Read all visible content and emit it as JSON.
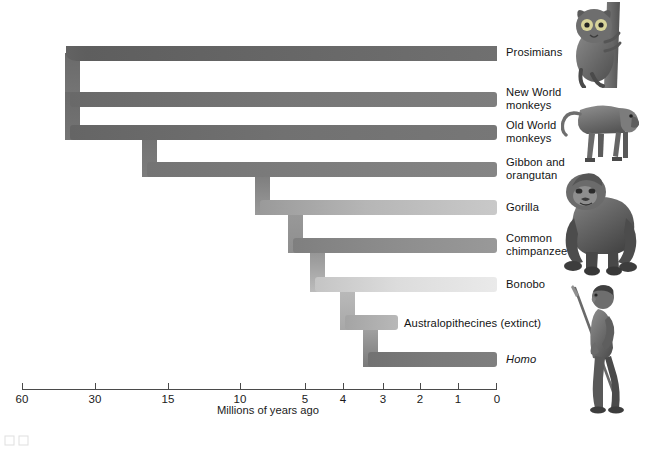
{
  "figure": {
    "type": "phylogenetic-tree",
    "background_color": "#ffffff",
    "text_color": "#141414"
  },
  "axis": {
    "caption": "Millions of years ago",
    "caption_x": 268,
    "caption_y": 404,
    "line_y": 389,
    "x_start": 22,
    "x_end": 497,
    "tick_height": 6,
    "color": "#4a4a4a",
    "ticks": [
      {
        "label": "60",
        "x": 22
      },
      {
        "label": "30",
        "x": 95
      },
      {
        "label": "15",
        "x": 168
      },
      {
        "label": "10",
        "x": 240
      },
      {
        "label": "5",
        "x": 305
      },
      {
        "label": "4",
        "x": 343
      },
      {
        "label": "3",
        "x": 383
      },
      {
        "label": "2",
        "x": 420
      },
      {
        "label": "1",
        "x": 458
      },
      {
        "label": "0",
        "x": 497
      }
    ]
  },
  "branches": [
    {
      "id": "prosimians",
      "label": "Prosimians",
      "label_x": 506,
      "label_y": 52,
      "italic": false,
      "band_y": 46,
      "band_height": 15,
      "split_x": 22,
      "end_x": 497,
      "color_left": "#5f5f5f",
      "color_right": "#6e6e6e"
    },
    {
      "id": "new-world-monkeys",
      "label": "New World\nmonkeys",
      "label_x": 506,
      "label_y": 92,
      "italic": false,
      "band_y": 92,
      "band_height": 15,
      "split_x": 65,
      "end_x": 497,
      "color_left": "#6f6f6f",
      "color_right": "#7d7d7d"
    },
    {
      "id": "old-world-monkeys",
      "label": "Old World\nmonkeys",
      "label_x": 506,
      "label_y": 126,
      "italic": false,
      "band_y": 125,
      "band_height": 15,
      "split_x": 65,
      "end_x": 497,
      "color_left": "#6b6b6b",
      "color_right": "#757575"
    },
    {
      "id": "gibbon-orangutan",
      "label": "Gibbon and\norangutan",
      "label_x": 506,
      "label_y": 163,
      "italic": false,
      "band_y": 162,
      "band_height": 15,
      "split_x": 142,
      "end_x": 497,
      "color_left": "#777777",
      "color_right": "#828282"
    },
    {
      "id": "gorilla",
      "label": "Gorilla",
      "label_x": 506,
      "label_y": 204,
      "italic": false,
      "band_y": 200,
      "band_height": 15,
      "split_x": 255,
      "end_x": 497,
      "color_left": "#9d9d9d",
      "color_right": "#c3c3c3"
    },
    {
      "id": "common-chimpanzee",
      "label": "Common\nchimpanzee",
      "label_x": 506,
      "label_y": 240,
      "italic": false,
      "band_y": 238,
      "band_height": 15,
      "split_x": 288,
      "end_x": 497,
      "color_left": "#828282",
      "color_right": "#969696"
    },
    {
      "id": "bonobo",
      "label": "Bonobo",
      "label_x": 506,
      "label_y": 283,
      "italic": false,
      "band_y": 277,
      "band_height": 15,
      "split_x": 310,
      "end_x": 497,
      "color_left": "#c8c8c8",
      "color_right": "#e6e6e6"
    },
    {
      "id": "australopithecines",
      "label": "Australopithecines (extinct)",
      "label_x": 404,
      "label_y": 324,
      "italic": false,
      "band_y": 315,
      "band_height": 15,
      "split_x": 340,
      "end_x": 398,
      "color_left": "#a8a8a8",
      "color_right": "#b4b4b4"
    },
    {
      "id": "homo",
      "label": "Homo",
      "label_x": 506,
      "label_y": 355,
      "italic": true,
      "band_y": 352,
      "band_height": 15,
      "split_x": 363,
      "end_x": 497,
      "color_left": "#757575",
      "color_right": "#7d7d7d"
    }
  ],
  "illustrations": [
    {
      "id": "tarsier-illustration",
      "name": "tarsier",
      "x": 567,
      "y": 2,
      "w": 66,
      "h": 86
    },
    {
      "id": "baboon-illustration",
      "name": "baboon",
      "x": 561,
      "y": 88,
      "w": 80,
      "h": 78
    },
    {
      "id": "gorilla-illustration",
      "name": "gorilla",
      "x": 556,
      "y": 166,
      "w": 86,
      "h": 110
    },
    {
      "id": "hominid-illustration",
      "name": "hominid-with-spear",
      "x": 565,
      "y": 282,
      "w": 70,
      "h": 132
    }
  ]
}
